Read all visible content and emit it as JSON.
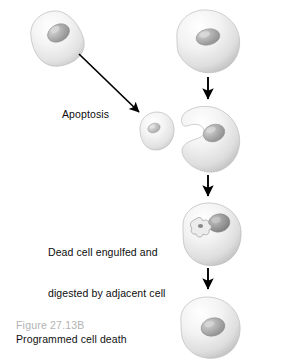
{
  "figure": {
    "domain": "biology-diagram",
    "caption_number": "Figure 27.13B",
    "caption_title": "Programmed cell death",
    "background_color": "#ffffff",
    "caption_number_color": "#b2b2b2",
    "caption_title_color": "#111111"
  },
  "labels": {
    "apoptosis": "Apoptosis",
    "engulf_line1": "Dead cell engulfed and",
    "engulf_line2": "digested by adjacent cell"
  },
  "cells": [
    {
      "id": "healthy-cell-left",
      "name": "healthy-cell-left",
      "description": "Healthy intact cell, upper left",
      "body_color": "#f2f2f2",
      "nucleus_color": "#a9a9a9"
    },
    {
      "id": "apoptotic-cell",
      "name": "apoptotic-cell",
      "description": "Small shrunken apoptotic cell",
      "body_color": "#f2f2f2",
      "nucleus_color": "#bdbdbd"
    },
    {
      "id": "neighbor-cell-top",
      "name": "neighbor-cell-top",
      "description": "Adjacent healthy cell, upper right",
      "body_color": "#f2f2f2",
      "nucleus_color": "#b4b4b4"
    },
    {
      "id": "engulfing-cell-crescent",
      "name": "engulfing-cell-crescent",
      "description": "Adjacent cell forming crescent to engulf dead cell",
      "body_color": "#f2f2f2",
      "nucleus_color": "#b0b0b0"
    },
    {
      "id": "cell-with-vesicle",
      "name": "cell-with-vesicle",
      "description": "Cell containing engulfed dead cell in a star-shaped vesicle",
      "body_color": "#eeeeee",
      "nucleus_color": "#9a9a9a",
      "vesicle_color": "#e2e2e2"
    },
    {
      "id": "cell-after-digestion",
      "name": "cell-after-digestion",
      "description": "Adjacent cell after digestion is complete",
      "body_color": "#f2f2f2",
      "nucleus_color": "#a6a6a6"
    }
  ],
  "arrows": [
    {
      "id": "arrow-apoptosis",
      "name": "arrow-apoptosis-diagonal",
      "color": "#000000"
    },
    {
      "id": "arrow-neighbor-1",
      "name": "arrow-neighbor-to-crescent",
      "color": "#000000"
    },
    {
      "id": "arrow-neighbor-2",
      "name": "arrow-crescent-to-engulfed",
      "color": "#000000"
    },
    {
      "id": "arrow-neighbor-3",
      "name": "arrow-engulfed-to-digested",
      "color": "#000000"
    }
  ]
}
